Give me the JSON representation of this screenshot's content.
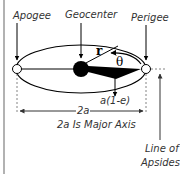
{
  "labels": {
    "apogee": "Apogee",
    "geocenter": "Geocenter",
    "perigee": "Perigee",
    "r": "r",
    "theta": "θ",
    "perigee_distance": "a(1-e)",
    "major_axis_short": "2a",
    "major_axis_caption": "2a Is Major Axis",
    "line_of_apsides_1": "Line of",
    "line_of_apsides_2": "Apsides"
  },
  "colors": {
    "line": "#000000",
    "text": "#333333",
    "border": "#999999",
    "dashed": "#666666"
  }
}
